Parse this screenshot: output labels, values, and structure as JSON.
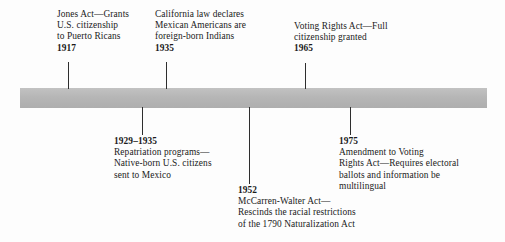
{
  "figure": {
    "type": "timeline",
    "orientation": "horizontal",
    "bar_color": "#b6b6b6",
    "background_color": "#ffffff",
    "text_color": "#1b1b1b",
    "tick_color": "#2e2e2e"
  },
  "entries": [
    {
      "id": "jones-act-1917",
      "year": "1917",
      "placement": "above",
      "year_position": "after",
      "lines": [
        "Jones Act—Grants",
        "U.S. citizenship",
        "to Puerto Ricans"
      ]
    },
    {
      "id": "california-law-1935",
      "year": "1935",
      "placement": "above",
      "year_position": "after",
      "lines": [
        "California law declares",
        "Mexican Americans are",
        "foreign-born Indians"
      ]
    },
    {
      "id": "voting-rights-act-1965",
      "year": "1965",
      "placement": "above",
      "year_position": "after",
      "lines": [
        "Voting Rights Act—Full",
        "citizenship granted"
      ]
    },
    {
      "id": "repatriation-1929-1935",
      "year": "1929–1935",
      "placement": "below",
      "year_position": "before",
      "lines": [
        "Repatriation programs—",
        "Native-born U.S. citizens",
        "sent to Mexico"
      ]
    },
    {
      "id": "mccarren-walter-act-1952",
      "year": "1952",
      "placement": "below",
      "year_position": "before",
      "lines": [
        "McCarren-Walter Act—",
        "Rescinds the racial restrictions",
        "of the 1790 Naturalization Act"
      ]
    },
    {
      "id": "voting-rights-amendment-1975",
      "year": "1975",
      "placement": "below",
      "year_position": "before",
      "lines": [
        "Amendment to Voting",
        "Rights Act—Requires electoral",
        "ballots and information be",
        "multilingual"
      ]
    }
  ]
}
